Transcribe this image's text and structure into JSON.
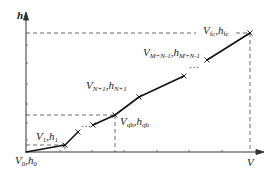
{
  "diagram": {
    "axes": {
      "x_label": "V",
      "y_label": "h"
    },
    "points": [
      {
        "id": "p0",
        "name": "V0,h0",
        "V": "V",
        "h": "h",
        "sub": "0",
        "x": 26,
        "y": 152
      },
      {
        "id": "p1",
        "name": "V1,h1",
        "V": "V",
        "h": "h",
        "sub": "1",
        "x": 65,
        "y": 145
      },
      {
        "id": "pa",
        "name": "",
        "x": 78,
        "y": 132
      },
      {
        "id": "pb",
        "name": "",
        "x": 93,
        "y": 125
      },
      {
        "id": "pqh",
        "name": "Vqh,hqh",
        "V": "V",
        "h": "h",
        "sub": "qh",
        "x": 115,
        "y": 115
      },
      {
        "id": "pN1",
        "name": "VN+1,hN+1",
        "V": "V",
        "h": "h",
        "sub": "N+1",
        "x": 139,
        "y": 97
      },
      {
        "id": "pc",
        "name": "",
        "x": 184,
        "y": 76
      },
      {
        "id": "pMN",
        "name": "VM+N-1,hM+N-1",
        "V": "V",
        "h": "h",
        "sub": "M+N-1",
        "x": 207,
        "y": 60
      },
      {
        "id": "pfc",
        "name": "Vfc,hfc",
        "V": "V",
        "h": "h",
        "sub": "fc",
        "x": 250,
        "y": 33
      }
    ],
    "ellipsis_text": "…",
    "ellipsis_vertical": "⋯",
    "separator": ","
  }
}
